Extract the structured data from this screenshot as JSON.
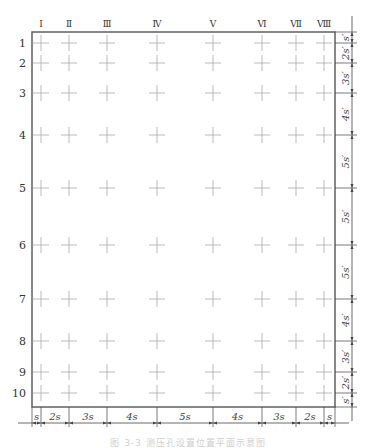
{
  "diagram": {
    "title": "",
    "columns": [
      {
        "label": "Ⅰ",
        "x": 41
      },
      {
        "label": "Ⅱ",
        "x": 69
      },
      {
        "label": "Ⅲ",
        "x": 107
      },
      {
        "label": "Ⅳ",
        "x": 157
      },
      {
        "label": "Ⅴ",
        "x": 213
      },
      {
        "label": "Ⅵ",
        "x": 262
      },
      {
        "label": "Ⅶ",
        "x": 296
      },
      {
        "label": "Ⅷ",
        "x": 324
      }
    ],
    "rows": [
      {
        "label": "1",
        "y": 43
      },
      {
        "label": "2",
        "y": 63
      },
      {
        "label": "3",
        "y": 93
      },
      {
        "label": "4",
        "y": 135
      },
      {
        "label": "5",
        "y": 188
      },
      {
        "label": "6",
        "y": 245
      },
      {
        "label": "7",
        "y": 299
      },
      {
        "label": "8",
        "y": 341
      },
      {
        "label": "9",
        "y": 372
      },
      {
        "label": "10",
        "y": 393
      }
    ],
    "border": {
      "left": 32,
      "top": 32,
      "right": 335,
      "bottom": 407
    },
    "bottom_dimensions": [
      "s",
      "2s",
      "3s",
      "4s",
      "5s",
      "4s",
      "3s",
      "2s",
      "s"
    ],
    "right_dimensions": [
      "s′",
      "2s′",
      "3s′",
      "4s′",
      "5s′",
      "5s′",
      "5s′",
      "4s′",
      "3s′",
      "2s′",
      "s′"
    ],
    "marker": "plus-cross",
    "colors": {
      "border": "#555555",
      "marker": "#aaaaaa",
      "text": "#333333",
      "dim": "#444444"
    }
  },
  "caption": "图 3-3  测压孔设置位置平面示意图"
}
